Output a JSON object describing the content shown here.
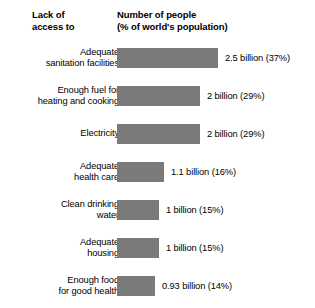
{
  "chart_data": {
    "type": "bar",
    "title": "",
    "orientation": "horizontal",
    "header_left": "Lack of\naccess to",
    "header_right": "Number of people\n(% of world's population)",
    "xlabel": "Number of people (% of world's population)",
    "ylabel": "Lack of access to",
    "grid": false,
    "legend": "none",
    "xlim": [
      0,
      2.5
    ],
    "unit": "billion people",
    "bar_color": "#7a7a7a",
    "categories": [
      "Adequate\nsanitation facilities",
      "Enough fuel for\nheating and cooking",
      "Electricity",
      "Adequate\nhealth care",
      "Clean drinking\nwater",
      "Adequate\nhousing",
      "Enough food\nfor good health"
    ],
    "values": [
      2.5,
      2,
      2,
      1.1,
      1,
      1,
      0.93
    ],
    "percents": [
      37,
      29,
      29,
      16,
      15,
      15,
      14
    ],
    "value_labels": [
      "2.5 billion (37%)",
      "2 billion (29%)",
      "2 billion (29%)",
      "1.1 billion (16%)",
      "1 billion (15%)",
      "1 billion (15%)",
      "0.93 billion (14%)"
    ],
    "bar_px_widths": [
      101,
      83,
      83,
      47,
      42,
      42,
      38
    ]
  }
}
